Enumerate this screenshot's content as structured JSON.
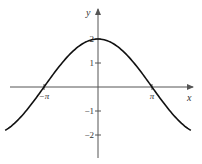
{
  "chart_data": {
    "type": "line",
    "title": "",
    "function": "y = 2cos(x/2)",
    "xlabel": "x",
    "ylabel": "y",
    "x_ticks": [
      {
        "value": -3.14159,
        "label": "−π"
      },
      {
        "value": 3.14159,
        "label": "π"
      }
    ],
    "y_ticks": [
      {
        "value": 2,
        "label": "2"
      },
      {
        "value": 1,
        "label": "1"
      },
      {
        "value": -1,
        "label": "−1"
      },
      {
        "value": -2,
        "label": "−2"
      }
    ],
    "xlim": [
      -5.4,
      5.4
    ],
    "ylim": [
      -2.9,
      3.3
    ],
    "grid": false,
    "legend": null,
    "series": [
      {
        "name": "curve",
        "color": "#111111",
        "x": [
          -5.4,
          -4.71,
          -3.14,
          -1.57,
          0,
          1.57,
          3.14,
          4.71,
          5.4
        ],
        "values": [
          -1.81,
          -1.41,
          0,
          1.41,
          2,
          1.41,
          0,
          -1.41,
          -1.81
        ]
      }
    ]
  },
  "colors": {
    "axis": "#555555",
    "curve": "#111111",
    "text": "#333333"
  }
}
